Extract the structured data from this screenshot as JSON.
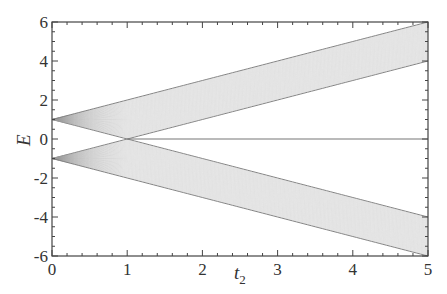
{
  "chart_data": {
    "type": "line",
    "title": "",
    "xlabel": "t2",
    "xlabel_main": "t",
    "xlabel_sub": "2",
    "ylabel": "E",
    "xlim": [
      0,
      5
    ],
    "ylim": [
      -6,
      6
    ],
    "x_ticks": [
      0,
      1,
      2,
      3,
      4,
      5
    ],
    "y_ticks": [
      -6,
      -4,
      -2,
      0,
      2,
      4,
      6
    ],
    "x_tick_labels": [
      "0",
      "1",
      "2",
      "3",
      "4",
      "5"
    ],
    "y_tick_labels": [
      "-6",
      "-4",
      "-2",
      "0",
      "2",
      "4",
      "6"
    ],
    "grid": false,
    "legend": null,
    "series": [
      {
        "name": "upper band top edge",
        "x": [
          0,
          1,
          2,
          3,
          4,
          5
        ],
        "values": [
          1,
          2,
          3,
          4,
          5,
          6
        ]
      },
      {
        "name": "upper band bottom edge",
        "x": [
          0,
          1,
          2,
          3,
          4,
          5
        ],
        "values": [
          1,
          0,
          1,
          2,
          3,
          4
        ]
      },
      {
        "name": "lower band top edge",
        "x": [
          0,
          1,
          2,
          3,
          4,
          5
        ],
        "values": [
          -1,
          0,
          -1,
          -2,
          -3,
          -4
        ]
      },
      {
        "name": "lower band bottom edge",
        "x": [
          0,
          1,
          2,
          3,
          4,
          5
        ],
        "values": [
          -1,
          -2,
          -3,
          -4,
          -5,
          -6
        ]
      },
      {
        "name": "zero mode",
        "x": [
          1,
          5
        ],
        "values": [
          0,
          0
        ]
      }
    ],
    "band_line_count": 40,
    "colors": {
      "lines": "#9a9a9a",
      "edges": "#777777",
      "axis": "#444444"
    }
  }
}
